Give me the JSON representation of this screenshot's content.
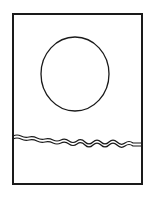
{
  "drawing": {
    "frame": {
      "x": 13,
      "y": 13,
      "width": 129,
      "height": 172,
      "stroke": "#1a1a1a"
    },
    "circle": {
      "cx": 75,
      "cy": 74,
      "rx": 34,
      "ry": 37,
      "stroke": "#1a1a1a"
    },
    "waves": {
      "stroke": "#1a1a1a",
      "y_top": 136,
      "y_bottom": 144
    }
  }
}
